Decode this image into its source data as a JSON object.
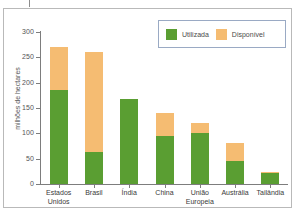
{
  "chart_data": {
    "type": "bar",
    "subtype": "stacked",
    "title": "",
    "xlabel": "",
    "ylabel": "milhões de hectares",
    "ylim": [
      0,
      300
    ],
    "yticks": [
      0,
      50,
      100,
      150,
      200,
      250,
      300
    ],
    "grid": false,
    "legend_position": "top-right",
    "categories": [
      "Estados\nUnidos",
      "Brasil",
      "Índia",
      "China",
      "União\nEuropeia",
      "Austrália",
      "Tailândia"
    ],
    "series": [
      {
        "name": "Utilizada",
        "color": "#5a9e32",
        "values": [
          186,
          63,
          168,
          94,
          100,
          45,
          22
        ]
      },
      {
        "name": "Disponível",
        "color": "#f5bc72",
        "values": [
          84,
          197,
          0,
          47,
          20,
          36,
          1
        ]
      }
    ],
    "totals": [
      270,
      260,
      168,
      141,
      120,
      81,
      23
    ]
  },
  "legend": {
    "items": [
      {
        "label": "Utilizada",
        "color": "#5a9e32"
      },
      {
        "label": "Disponível",
        "color": "#f5bc72"
      }
    ]
  },
  "axis": {
    "y_labels": [
      "300",
      "250",
      "200",
      "150",
      "100",
      "50",
      "0"
    ],
    "y_title": "milhões de hectares"
  }
}
